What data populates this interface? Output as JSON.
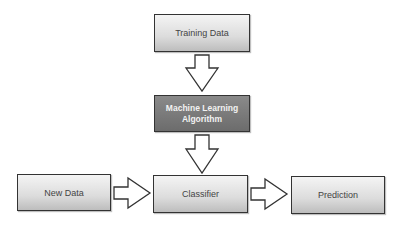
{
  "diagram": {
    "nodes": [
      {
        "id": "training-data",
        "label": "Training Data"
      },
      {
        "id": "ml-algorithm",
        "label": "Machine Learning Algorithm",
        "lines": [
          "Machine Learning",
          "Algorithm"
        ]
      },
      {
        "id": "new-data",
        "label": "New Data"
      },
      {
        "id": "classifier",
        "label": "Classifier"
      },
      {
        "id": "prediction",
        "label": "Prediction"
      }
    ],
    "edges": [
      {
        "from": "training-data",
        "to": "ml-algorithm",
        "direction": "down"
      },
      {
        "from": "ml-algorithm",
        "to": "classifier",
        "direction": "down"
      },
      {
        "from": "new-data",
        "to": "classifier",
        "direction": "right"
      },
      {
        "from": "classifier",
        "to": "prediction",
        "direction": "right"
      }
    ],
    "colors": {
      "box_fill_light": "#dcdcdc",
      "box_fill_dark": "#6c6c6c",
      "border": "#333333",
      "arrow_fill": "#ffffff"
    }
  }
}
